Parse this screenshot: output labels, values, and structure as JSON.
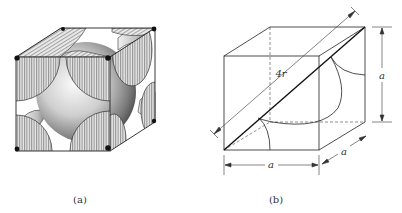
{
  "figure": {
    "panels": [
      {
        "id": "a",
        "caption": "(a)",
        "description": "Face-centered cubic unit cell, hard-sphere model with sectioned corner and face atoms"
      },
      {
        "id": "b",
        "caption": "(b)",
        "description": "FCC unit cell showing face diagonal relation",
        "labels": {
          "diagonal": "4r",
          "height": "a",
          "width": "a",
          "depth": "a"
        }
      }
    ]
  }
}
